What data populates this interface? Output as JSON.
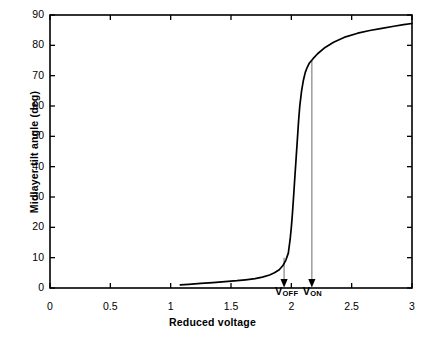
{
  "chart_data": {
    "type": "line",
    "title": "",
    "xlabel": "Reduced  voltage",
    "ylabel": "Midlayer tilt angle (deg)",
    "xlim": [
      0,
      3
    ],
    "ylim": [
      0,
      90
    ],
    "grid": false,
    "legend": null,
    "xticks": [
      0,
      0.5,
      1,
      1.5,
      2,
      2.5,
      3
    ],
    "xtick_labels": [
      "0",
      "0.5",
      "1",
      "1.5",
      "2",
      "2.5",
      "3"
    ],
    "yticks": [
      0,
      10,
      20,
      30,
      40,
      50,
      60,
      70,
      80,
      90
    ],
    "ytick_labels": [
      "0",
      "10",
      "20",
      "30",
      "40",
      "50",
      "60",
      "70",
      "80",
      "90"
    ],
    "series": [
      {
        "name": "midlayer tilt angle",
        "color": "#000000",
        "x": [
          1.08,
          1.15,
          1.25,
          1.35,
          1.45,
          1.55,
          1.62,
          1.7,
          1.76,
          1.82,
          1.86,
          1.9,
          1.93,
          1.955,
          1.975,
          1.99,
          2.0,
          2.01,
          2.02,
          2.03,
          2.04,
          2.05,
          2.06,
          2.07,
          2.085,
          2.1,
          2.115,
          2.13,
          2.15,
          2.18,
          2.22,
          2.28,
          2.35,
          2.45,
          2.55,
          2.65,
          2.75,
          2.85,
          2.93,
          3.0
        ],
        "y": [
          1.0,
          1.2,
          1.5,
          1.8,
          2.1,
          2.4,
          2.7,
          3.1,
          3.6,
          4.3,
          5.0,
          6.0,
          7.4,
          9.2,
          11.5,
          16.0,
          20.0,
          25.0,
          31.0,
          37.0,
          43.0,
          49.0,
          55.0,
          60.0,
          65.0,
          68.5,
          71.0,
          72.6,
          74.2,
          75.6,
          77.3,
          79.3,
          81.0,
          82.8,
          84.0,
          84.9,
          85.6,
          86.3,
          86.8,
          87.2
        ]
      }
    ],
    "annotations": [
      {
        "name": "V_OFF",
        "label": "V",
        "subscript": "OFF",
        "x": 1.94,
        "y_top": 10.0,
        "arrow_color": "#8c8c8c",
        "head_color": "#000000"
      },
      {
        "name": "V_ON",
        "label": "V",
        "subscript": "ON",
        "x": 2.17,
        "y_top": 75.0,
        "arrow_color": "#8c8c8c",
        "head_color": "#000000"
      }
    ],
    "axis_color": "#000000",
    "background": "#ffffff"
  }
}
